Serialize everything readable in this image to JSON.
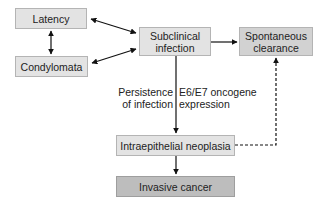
{
  "diagram": {
    "nodes": {
      "latency": "Latency",
      "condylomata": "Condylomata",
      "subclinical_infection": "Subclinical infection",
      "spontaneous_clearance": "Spontaneous clearance",
      "intraepithelial_neoplasia": "Intraepithelial neoplasia",
      "invasive_cancer": "Invasive cancer"
    },
    "edge_labels": {
      "persistence_line1": "Persistence",
      "persistence_line2": "of infection",
      "oncogene_line1": "E6/E7 oncogene",
      "oncogene_line2": "expression"
    },
    "edges": [
      {
        "from": "Latency",
        "to": "Condylomata",
        "style": "solid",
        "bidirectional": true
      },
      {
        "from": "Latency",
        "to": "Subclinical infection",
        "style": "solid",
        "bidirectional": true
      },
      {
        "from": "Condylomata",
        "to": "Subclinical infection",
        "style": "solid",
        "bidirectional": true
      },
      {
        "from": "Subclinical infection",
        "to": "Spontaneous clearance",
        "style": "solid"
      },
      {
        "from": "Subclinical infection",
        "to": "Intraepithelial neoplasia",
        "style": "solid"
      },
      {
        "from": "Intraepithelial neoplasia",
        "to": "Invasive cancer",
        "style": "solid"
      },
      {
        "from": "Intraepithelial neoplasia",
        "to": "Spontaneous clearance",
        "style": "dashed"
      }
    ],
    "colors": {
      "box_light": "#e3e3e3",
      "box_mid": "#d2d2d2",
      "box_dark": "#bdbdbd",
      "arrow": "#111111"
    }
  }
}
